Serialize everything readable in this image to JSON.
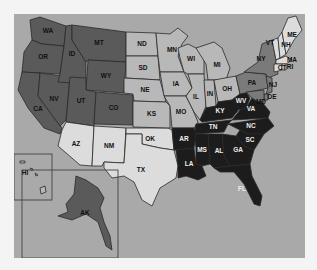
{
  "map": {
    "type": "choropleth",
    "region": "United States",
    "ocean_color": "#a9a9a9",
    "classes": {
      "c1": "#dcdcdc",
      "c2": "#b8b8b8",
      "c3": "#7a7a7a",
      "c4": "#5a5a5a",
      "c5": "#1c1c1c"
    },
    "states": {
      "WA": {
        "label": "WA",
        "class": "c4"
      },
      "OR": {
        "label": "OR",
        "class": "c4"
      },
      "CA": {
        "label": "CA",
        "class": "c4"
      },
      "NV": {
        "label": "NV",
        "class": "c4"
      },
      "ID": {
        "label": "ID",
        "class": "c4"
      },
      "MT": {
        "label": "MT",
        "class": "c4"
      },
      "WY": {
        "label": "WY",
        "class": "c4"
      },
      "UT": {
        "label": "UT",
        "class": "c4"
      },
      "CO": {
        "label": "CO",
        "class": "c4"
      },
      "AZ": {
        "label": "AZ",
        "class": "c1"
      },
      "NM": {
        "label": "NM",
        "class": "c1"
      },
      "ND": {
        "label": "ND",
        "class": "c2"
      },
      "SD": {
        "label": "SD",
        "class": "c2"
      },
      "NE": {
        "label": "NE",
        "class": "c2"
      },
      "KS": {
        "label": "KS",
        "class": "c2"
      },
      "OK": {
        "label": "OK",
        "class": "c1"
      },
      "TX": {
        "label": "TX",
        "class": "c1"
      },
      "MN": {
        "label": "MN",
        "class": "c2"
      },
      "IA": {
        "label": "IA",
        "class": "c2"
      },
      "MO": {
        "label": "MO",
        "class": "c2"
      },
      "AR": {
        "label": "AR",
        "class": "c5"
      },
      "LA": {
        "label": "LA",
        "class": "c5"
      },
      "WI": {
        "label": "WI",
        "class": "c2"
      },
      "IL": {
        "label": "IL",
        "class": "c2"
      },
      "MI": {
        "label": "MI",
        "class": "c2"
      },
      "IN": {
        "label": "IN",
        "class": "c2"
      },
      "OH": {
        "label": "OH",
        "class": "c2"
      },
      "KY": {
        "label": "KY",
        "class": "c5"
      },
      "TN": {
        "label": "TN",
        "class": "c5"
      },
      "MS": {
        "label": "MS",
        "class": "c5"
      },
      "AL": {
        "label": "AL",
        "class": "c5"
      },
      "GA": {
        "label": "GA",
        "class": "c5"
      },
      "FL": {
        "label": "FL",
        "class": "c5"
      },
      "SC": {
        "label": "SC",
        "class": "c5"
      },
      "NC": {
        "label": "NC",
        "class": "c5"
      },
      "VA": {
        "label": "VA",
        "class": "c5"
      },
      "WV": {
        "label": "WV",
        "class": "c5"
      },
      "MD": {
        "label": "MD",
        "class": "c3"
      },
      "DE": {
        "label": "DE",
        "class": "c3"
      },
      "PA": {
        "label": "PA",
        "class": "c3"
      },
      "NJ": {
        "label": "NJ",
        "class": "c3"
      },
      "NY": {
        "label": "NY",
        "class": "c3"
      },
      "CT": {
        "label": "CT",
        "class": "c1"
      },
      "RI": {
        "label": "RI",
        "class": "c1"
      },
      "MA": {
        "label": "MA",
        "class": "c1"
      },
      "VT": {
        "label": "VT",
        "class": "c1"
      },
      "NH": {
        "label": "NH",
        "class": "c1"
      },
      "ME": {
        "label": "ME",
        "class": "c1"
      },
      "AK": {
        "label": "AK",
        "class": "c4"
      },
      "HI": {
        "label": "HI",
        "class": "c2"
      }
    }
  }
}
